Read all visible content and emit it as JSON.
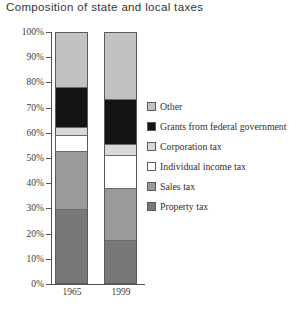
{
  "chart_data": {
    "type": "bar",
    "subtype": "stacked-percentage",
    "title": "Composition of state and local taxes",
    "xlabel": "",
    "ylabel": "",
    "categories": [
      "1965",
      "1999"
    ],
    "ylim": [
      0,
      100
    ],
    "y_tick_labels": [
      "0%",
      "10%",
      "20%",
      "30%",
      "40%",
      "50%",
      "60%",
      "70%",
      "80%",
      "90%",
      "100%"
    ],
    "y_tick_values": [
      0,
      10,
      20,
      30,
      40,
      50,
      60,
      70,
      80,
      90,
      100
    ],
    "grid": false,
    "legend_position": "right",
    "series": [
      {
        "name": "Other",
        "color": "#c2c2c2",
        "values": [
          22,
          27
        ]
      },
      {
        "name": "Grants from federal government",
        "color": "#141414",
        "values": [
          16,
          18
        ]
      },
      {
        "name": "Corporation tax",
        "color": "#d9d9d9",
        "values": [
          3,
          4
        ]
      },
      {
        "name": "Individual income tax",
        "color": "#ffffff",
        "values": [
          6,
          13
        ]
      },
      {
        "name": "Sales tax",
        "color": "#9a9a9a",
        "values": [
          23,
          21
        ]
      },
      {
        "name": "Property tax",
        "color": "#787878",
        "values": [
          30,
          17
        ]
      }
    ],
    "stack_order_top_to_bottom": [
      "Other",
      "Grants from federal government",
      "Corporation tax",
      "Individual income tax",
      "Sales tax",
      "Property tax"
    ]
  },
  "legend": {
    "items": [
      {
        "label": "Other",
        "color": "#c2c2c2"
      },
      {
        "label": "Grants from federal government",
        "color": "#141414"
      },
      {
        "label": "Corporation tax",
        "color": "#d9d9d9"
      },
      {
        "label": "Individual income tax",
        "color": "#ffffff"
      },
      {
        "label": "Sales tax",
        "color": "#9a9a9a"
      },
      {
        "label": "Property tax",
        "color": "#787878"
      }
    ]
  }
}
